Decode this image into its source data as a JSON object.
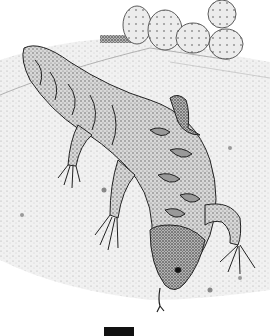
{
  "image": {
    "subject": "Stippled pen-and-ink illustration of a Gila monster lizard walking down a rocky slope with prickly pear cacti in the background",
    "elements": [
      "prickly-pear-cactus",
      "gila-monster-lizard",
      "rocky-ground",
      "forked-tongue",
      "black-bar"
    ],
    "colors": {
      "background": "#ffffff",
      "ink": "#222222",
      "shade": "#9a9a9a",
      "bar": "#111111"
    }
  }
}
